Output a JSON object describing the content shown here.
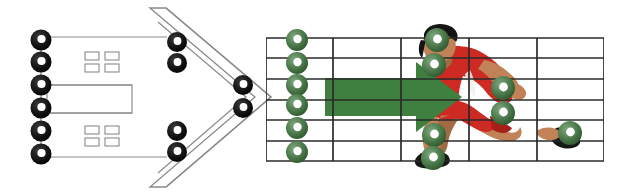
{
  "canvas": {
    "width": 634,
    "height": 195,
    "background": "#ffffff"
  },
  "palette": {
    "ring_black": "#111111",
    "ring_green_dark": "#2f5c2f",
    "ring_green": "#4c7a4c",
    "ring_green_light": "#6f9a6f",
    "arrow_green": "#3f7f3f",
    "panel_outline": "#8a8a8a",
    "grid_line": "#2a2a2a",
    "skin": "#c08256",
    "skin_shadow": "#a06a42",
    "jersey_red": "#cc2a22",
    "jersey_red_dark": "#a61f19",
    "hair_black": "#141414",
    "shoe_black": "#171717"
  },
  "diagram": {
    "stages": [
      {
        "name": "input-panel",
        "label": "Input panel with connector nodes"
      },
      {
        "name": "funnel-chevron",
        "label": "Chevron funnel with connector nodes"
      },
      {
        "name": "grid-overlay",
        "label": "Grid overlay with motion arrow and runner"
      }
    ]
  },
  "input_panel": {
    "name": "input-panel",
    "outline_color": "#8a8a8a",
    "connector_count": 6,
    "connectors": [
      {
        "id": "in-1",
        "cx": 41,
        "cy": 40,
        "r": 10.5,
        "color": "black"
      },
      {
        "id": "in-2",
        "cx": 41,
        "cy": 62,
        "r": 10.5,
        "color": "black"
      },
      {
        "id": "in-3",
        "cx": 41,
        "cy": 85,
        "r": 10.5,
        "color": "black"
      },
      {
        "id": "in-4",
        "cx": 41,
        "cy": 108,
        "r": 10.5,
        "color": "black"
      },
      {
        "id": "in-5",
        "cx": 41,
        "cy": 131,
        "r": 10.5,
        "color": "black"
      },
      {
        "id": "in-6",
        "cx": 41,
        "cy": 154,
        "r": 10.5,
        "color": "black"
      }
    ],
    "lead_lines": [
      {
        "id": "lead-top",
        "x1": 41,
        "y1": 37,
        "x2": 167,
        "y2": 37
      },
      {
        "id": "lead-bottom",
        "x1": 41,
        "y1": 157,
        "x2": 167,
        "y2": 157
      }
    ],
    "center_box": {
      "id": "center-box",
      "x": 47,
      "y": 85,
      "width": 85,
      "height": 28
    },
    "square_clusters": [
      {
        "id": "cluster-top",
        "x": 85,
        "y": 52,
        "cell_w": 14,
        "cell_h": 8,
        "gap_x": 6,
        "gap_y": 4,
        "cols": 2,
        "rows": 2
      },
      {
        "id": "cluster-bottom",
        "x": 85,
        "y": 126,
        "cell_w": 14,
        "cell_h": 8,
        "gap_x": 6,
        "gap_y": 4,
        "cols": 2,
        "rows": 2
      }
    ]
  },
  "funnel": {
    "name": "funnel-chevron",
    "outline_color": "#8a8a8a",
    "outer_path": "M 150 8 L 255 97 L 150 187 L 164 187 L 269 97 L 164 8 Z",
    "inner_path": "M 158 20 L 249 97 L 158 175",
    "connectors": [
      {
        "id": "fn-1",
        "cx": 177,
        "cy": 42,
        "r": 10,
        "color": "black"
      },
      {
        "id": "fn-2",
        "cx": 177,
        "cy": 63,
        "r": 10,
        "color": "black"
      },
      {
        "id": "fn-3",
        "cx": 177,
        "cy": 131,
        "r": 10,
        "color": "black"
      },
      {
        "id": "fn-4",
        "cx": 177,
        "cy": 152,
        "r": 10,
        "color": "black"
      },
      {
        "id": "fn-5",
        "cx": 243,
        "cy": 85,
        "r": 10,
        "color": "black"
      },
      {
        "id": "fn-6",
        "cx": 243,
        "cy": 108,
        "r": 10,
        "color": "black"
      }
    ]
  },
  "grid": {
    "name": "grid-overlay",
    "line_color": "#2a2a2a",
    "left": 266,
    "right": 604,
    "top": 38,
    "bottom": 161,
    "columns": 5,
    "rows": 6,
    "vertical_x": [
      266,
      333,
      401,
      469,
      537,
      604
    ],
    "horizontal_y": [
      38,
      58,
      79,
      100,
      120,
      141,
      161
    ]
  },
  "arrow": {
    "name": "motion-arrow",
    "color": "#3f7f3f",
    "points": "325,78 416,78 416,62 462,97 416,132 416,116 325,116",
    "direction": "right"
  },
  "markers": {
    "name": "green-markers",
    "color_outer": "#2f5c2f",
    "color_inner": "#6f9a6f",
    "column_group": [
      {
        "id": "mk-col-1",
        "cx": 297,
        "cy": 40,
        "r": 11
      },
      {
        "id": "mk-col-2",
        "cx": 297,
        "cy": 63,
        "r": 11
      },
      {
        "id": "mk-col-3",
        "cx": 297,
        "cy": 85,
        "r": 11
      },
      {
        "id": "mk-col-4",
        "cx": 297,
        "cy": 105,
        "r": 11
      },
      {
        "id": "mk-col-5",
        "cx": 297,
        "cy": 128,
        "r": 11
      },
      {
        "id": "mk-col-6",
        "cx": 297,
        "cy": 152,
        "r": 11
      }
    ],
    "body_group": [
      {
        "id": "mk-head",
        "cx": 437,
        "cy": 40,
        "r": 12,
        "joint": "head"
      },
      {
        "id": "mk-shoulder",
        "cx": 434,
        "cy": 65,
        "r": 12,
        "joint": "shoulder"
      },
      {
        "id": "mk-hand-front",
        "cx": 503,
        "cy": 88,
        "r": 12,
        "joint": "front-hand"
      },
      {
        "id": "mk-hip",
        "cx": 503,
        "cy": 113,
        "r": 12,
        "joint": "hip"
      },
      {
        "id": "mk-knee",
        "cx": 434,
        "cy": 135,
        "r": 12,
        "joint": "knee"
      },
      {
        "id": "mk-foot-rear",
        "cx": 433,
        "cy": 158,
        "r": 12,
        "joint": "rear-foot"
      },
      {
        "id": "mk-foot-front",
        "cx": 570,
        "cy": 133,
        "r": 12,
        "joint": "front-foot"
      }
    ]
  },
  "runner": {
    "name": "runner-figure",
    "label": "Sprinting athlete illustration",
    "colors": {
      "skin": "#c08256",
      "skin_shadow": "#a06a42",
      "jersey": "#cc2a22",
      "jersey_dark": "#a61f19",
      "hair": "#141414",
      "shoe": "#171717"
    }
  }
}
